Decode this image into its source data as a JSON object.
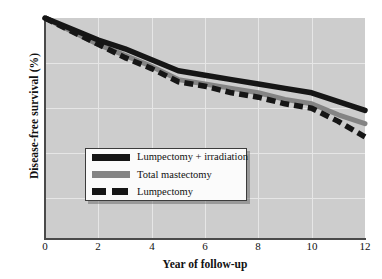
{
  "chart_data": {
    "type": "line",
    "title": "",
    "xlabel": "Year of follow-up",
    "ylabel": "Disease-free survival (%)",
    "xlim": [
      0,
      12
    ],
    "ylim": [
      0,
      100
    ],
    "xticks": [
      "0",
      "2",
      "4",
      "6",
      "8",
      "10",
      "12"
    ],
    "yticks": [
      "0",
      "20",
      "40",
      "60",
      "80",
      "100"
    ],
    "grid": true,
    "legend_position": "center-left",
    "x": [
      0,
      1,
      2,
      3,
      4,
      5,
      6,
      7,
      8,
      9,
      10,
      11,
      12
    ],
    "series": [
      {
        "name": "Lumpectomy + irradiation",
        "style": "solid",
        "color": "#161616",
        "values": [
          100,
          95,
          90,
          86,
          81,
          76,
          74,
          72,
          70,
          68,
          66,
          62,
          58
        ]
      },
      {
        "name": "Total mastectomy",
        "style": "solid",
        "color": "#848484",
        "values": [
          100,
          94,
          88,
          83,
          78,
          72,
          70,
          68,
          66,
          63,
          61,
          56,
          52
        ]
      },
      {
        "name": "Lumpectomy",
        "style": "dashed",
        "color": "#161616",
        "values": [
          100,
          94,
          88,
          82,
          77,
          71,
          69,
          66,
          64,
          61,
          59,
          53,
          46
        ]
      }
    ]
  },
  "axis": {
    "y_title": "Disease-free survival (%)",
    "x_title": "Year of follow-up",
    "y_labels": [
      "100",
      "80",
      "60",
      "40",
      "20",
      "0"
    ],
    "x_labels": [
      "0",
      "2",
      "4",
      "6",
      "8",
      "10",
      "12"
    ]
  },
  "legend": {
    "items": [
      {
        "label": "Lumpectomy + irradiation",
        "swatch": "solid-black-swatch"
      },
      {
        "label": "Total mastectomy",
        "swatch": "solid-gray-swatch"
      },
      {
        "label": "Lumpectomy",
        "swatch": "dashed-black-swatch"
      }
    ]
  },
  "colors": {
    "plot_background": "#cdcdcd",
    "gridline": "#e6e6e6",
    "axis": "#4a4a4a",
    "series_black": "#161616",
    "series_gray": "#848484",
    "legend_background": "#fbfbfb",
    "legend_border": "#3c3c3c"
  }
}
